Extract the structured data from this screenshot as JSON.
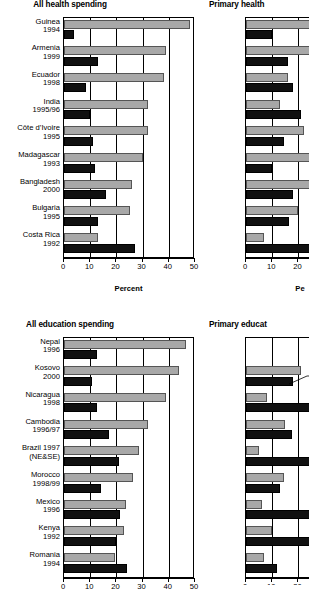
{
  "figure": {
    "axis_title": "Percent",
    "colors": {
      "quintile_poorest": "#a8a8a8",
      "quintile_richest": "#111111"
    }
  },
  "panels": [
    {
      "id": "all-health-spending",
      "title": "All health spending",
      "xlabel": "Percent",
      "ticks": [
        0,
        10,
        20,
        30,
        40,
        50
      ],
      "xlim": [
        0,
        50
      ],
      "clipped": false
    },
    {
      "id": "primary-health-spending",
      "title": "Primary health",
      "xlabel": "Pe",
      "ticks": [
        0,
        10,
        20
      ],
      "xlim": [
        0,
        25
      ],
      "clipped": true
    },
    {
      "id": "all-education-spending",
      "title": "All education spending",
      "xlabel": "",
      "ticks": [
        0,
        10,
        20,
        30,
        40,
        50
      ],
      "xlim": [
        0,
        50
      ],
      "clipped": false
    },
    {
      "id": "primary-education-spending",
      "title": "Primary educat",
      "xlabel": "",
      "ticks": [
        0,
        10,
        20
      ],
      "xlim": [
        0,
        25
      ],
      "clipped": true
    }
  ],
  "chart_data": [
    {
      "type": "bar",
      "title": "All health spending",
      "xlabel": "Percent",
      "ylabel": "",
      "xlim": [
        0,
        50
      ],
      "ticks": [
        0,
        10,
        20,
        30,
        40,
        50
      ],
      "grid": true,
      "orientation": "horizontal",
      "legend": [
        "Poorest quintile",
        "Richest quintile"
      ],
      "categories": [
        {
          "country": "Guinea",
          "year": "1994"
        },
        {
          "country": "Armenia",
          "year": "1999"
        },
        {
          "country": "Ecuador",
          "year": "1998"
        },
        {
          "country": "India",
          "year": "1995/96"
        },
        {
          "country": "Côte d’Ivoire",
          "year": "1995"
        },
        {
          "country": "Madagascar",
          "year": "1993"
        },
        {
          "country": "Bangladesh",
          "year": "2000"
        },
        {
          "country": "Bulgaria",
          "year": "1995"
        },
        {
          "country": "Costa Rica",
          "year": "1992"
        }
      ],
      "series": [
        {
          "name": "gray",
          "values": [
            48,
            39,
            38,
            32,
            32,
            30,
            26,
            25,
            13
          ]
        },
        {
          "name": "black",
          "values": [
            4,
            13,
            8.5,
            10,
            11,
            12,
            16,
            13,
            27
          ]
        }
      ]
    },
    {
      "type": "bar",
      "title": "Primary health",
      "xlabel": "Pe",
      "ylabel": "",
      "xlim": [
        0,
        25
      ],
      "ticks": [
        0,
        10,
        20
      ],
      "grid": true,
      "orientation": "horizontal",
      "clipped_right": true,
      "categories": [
        {
          "country": "Guinea",
          "year": "1994"
        },
        {
          "country": "Armenia",
          "year": "1999"
        },
        {
          "country": "Ecuador",
          "year": "1998"
        },
        {
          "country": "India",
          "year": "1995/96"
        },
        {
          "country": "Côte d’Ivoire",
          "year": "1995"
        },
        {
          "country": "Madagascar",
          "year": "1993"
        },
        {
          "country": "Bangladesh",
          "year": "2000"
        },
        {
          "country": "Bulgaria",
          "year": "1995"
        },
        {
          "country": "Costa Rica",
          "year": "1992"
        }
      ],
      "series": [
        {
          "name": "gray",
          "values": [
            25,
            25,
            16,
            13,
            22,
            25,
            25,
            20,
            7
          ]
        },
        {
          "name": "black",
          "values": [
            10,
            16,
            18,
            21,
            14.5,
            10,
            18,
            16.5,
            25
          ]
        }
      ]
    },
    {
      "type": "bar",
      "title": "All education spending",
      "xlabel": "",
      "ylabel": "",
      "xlim": [
        0,
        50
      ],
      "ticks": [
        0,
        10,
        20,
        30,
        40,
        50
      ],
      "grid": true,
      "orientation": "horizontal",
      "categories": [
        {
          "country": "Nepal",
          "year": "1996"
        },
        {
          "country": "Kosovo",
          "year": "2000"
        },
        {
          "country": "Nicaragua",
          "year": "1998"
        },
        {
          "country": "Cambodia",
          "year": "1996/97"
        },
        {
          "country": "Brazil 1997",
          "year": "(NE&SE)"
        },
        {
          "country": "Morocco",
          "year": "1998/99"
        },
        {
          "country": "Mexico",
          "year": "1996"
        },
        {
          "country": "Kenya",
          "year": "1992"
        },
        {
          "country": "Romania",
          "year": "1994"
        }
      ],
      "series": [
        {
          "name": "gray",
          "values": [
            46.5,
            44,
            39,
            32,
            28.5,
            26.5,
            23.5,
            23,
            19.5
          ]
        },
        {
          "name": "black",
          "values": [
            12.5,
            10.5,
            12.5,
            17,
            21,
            14,
            21.5,
            20,
            24
          ]
        }
      ]
    },
    {
      "type": "bar",
      "title": "Primary educat",
      "xlabel": "",
      "ylabel": "",
      "xlim": [
        0,
        25
      ],
      "ticks": [
        0,
        10,
        20
      ],
      "grid": true,
      "orientation": "horizontal",
      "clipped_right": true,
      "categories": [
        {
          "country": "Nepal",
          "year": "1996"
        },
        {
          "country": "Kosovo",
          "year": "2000"
        },
        {
          "country": "Nicaragua",
          "year": "1998"
        },
        {
          "country": "Cambodia",
          "year": "1996/97"
        },
        {
          "country": "Brazil 1997",
          "year": "(NE&SE)"
        },
        {
          "country": "Morocco",
          "year": "1998/99"
        },
        {
          "country": "Mexico",
          "year": "1996"
        },
        {
          "country": "Kenya",
          "year": "1992"
        },
        {
          "country": "Romania",
          "year": "1994"
        }
      ],
      "series": [
        {
          "name": "gray",
          "values": [
            0,
            21,
            8,
            15,
            5,
            14.5,
            6,
            10,
            7
          ]
        },
        {
          "name": "black",
          "values": [
            0,
            18,
            25,
            17.5,
            25,
            13,
            25,
            25,
            12
          ]
        }
      ]
    }
  ]
}
